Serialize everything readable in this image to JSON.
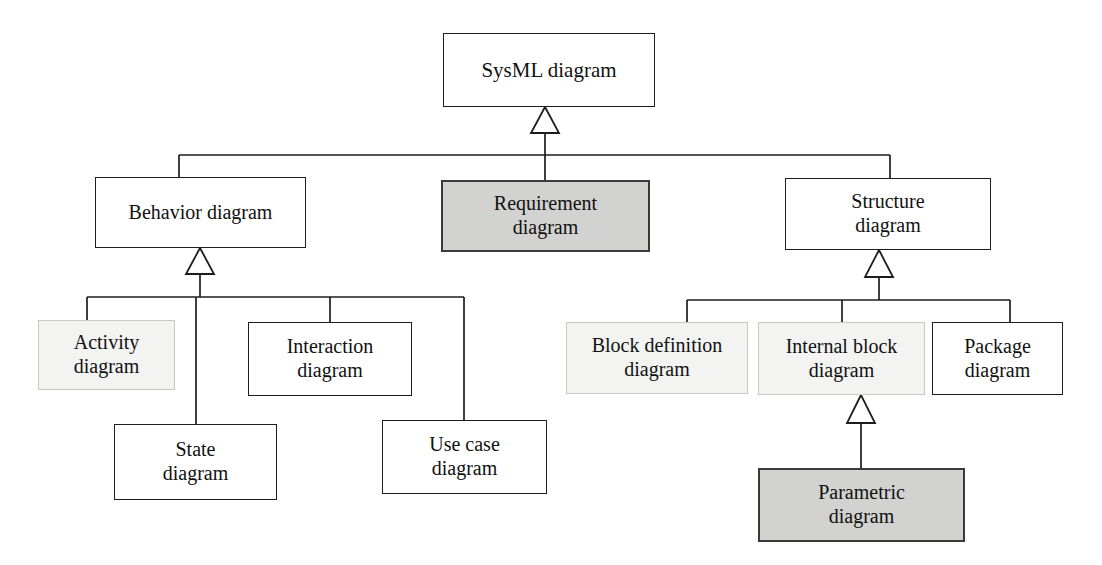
{
  "diagram": {
    "type": "hierarchy-tree",
    "notation": "UML/SysML generalization (hollow triangle arrowheads point to the parent)",
    "colors": {
      "background": "#ffffff",
      "line": "#1d1d1d",
      "text": "#111111",
      "plain_fill": "#ffffff",
      "plain_border": "#1d1d1d",
      "faint_fill": "#f3f3f1",
      "faint_border": "#c8c8c4",
      "shaded_fill": "#d2d2d0",
      "shaded_border": "#3a3a3a"
    },
    "nodes": [
      {
        "id": "sysml",
        "label": "SysML diagram",
        "style": "plain",
        "level": 0,
        "parent": null,
        "x": 443,
        "y": 33,
        "w": 212,
        "h": 74,
        "font_size": 21
      },
      {
        "id": "behavior",
        "label": "Behavior diagram",
        "style": "plain",
        "level": 1,
        "parent": "sysml",
        "x": 95,
        "y": 177,
        "w": 211,
        "h": 71,
        "font_size": 20
      },
      {
        "id": "requirement",
        "label": "Requirement\ndiagram",
        "style": "shaded",
        "level": 1,
        "parent": "sysml",
        "x": 441,
        "y": 180,
        "w": 209,
        "h": 72,
        "font_size": 20
      },
      {
        "id": "structure",
        "label": "Structure\ndiagram",
        "style": "plain",
        "level": 1,
        "parent": "sysml",
        "x": 785,
        "y": 178,
        "w": 206,
        "h": 72,
        "font_size": 20
      },
      {
        "id": "activity",
        "label": "Activity\ndiagram",
        "style": "faint",
        "level": 2,
        "parent": "behavior",
        "x": 38,
        "y": 320,
        "w": 137,
        "h": 70,
        "font_size": 20
      },
      {
        "id": "state",
        "label": "State\ndiagram",
        "style": "plain",
        "level": 2,
        "parent": "behavior",
        "x": 114,
        "y": 424,
        "w": 163,
        "h": 76,
        "font_size": 20
      },
      {
        "id": "interaction",
        "label": "Interaction\ndiagram",
        "style": "plain",
        "level": 2,
        "parent": "behavior",
        "x": 248,
        "y": 322,
        "w": 164,
        "h": 74,
        "font_size": 20
      },
      {
        "id": "usecase",
        "label": "Use case\ndiagram",
        "style": "plain",
        "level": 2,
        "parent": "behavior",
        "x": 382,
        "y": 420,
        "w": 165,
        "h": 74,
        "font_size": 20
      },
      {
        "id": "blockdef",
        "label": "Block definition\ndiagram",
        "style": "faint",
        "level": 2,
        "parent": "structure",
        "x": 566,
        "y": 322,
        "w": 182,
        "h": 72,
        "font_size": 20
      },
      {
        "id": "internalblock",
        "label": "Internal block\ndiagram",
        "style": "faint",
        "level": 2,
        "parent": "structure",
        "x": 758,
        "y": 322,
        "w": 167,
        "h": 73,
        "font_size": 20
      },
      {
        "id": "package",
        "label": "Package\ndiagram",
        "style": "plain",
        "level": 2,
        "parent": "structure",
        "x": 932,
        "y": 322,
        "w": 131,
        "h": 73,
        "font_size": 20
      },
      {
        "id": "parametric",
        "label": "Parametric\ndiagram",
        "style": "shaded",
        "level": 3,
        "parent": "internalblock",
        "x": 758,
        "y": 468,
        "w": 207,
        "h": 74,
        "font_size": 20
      }
    ],
    "edges": [
      {
        "id": "edge-sysml-children",
        "from_parent": "sysml",
        "to_children": [
          "behavior",
          "requirement",
          "structure"
        ],
        "arrow_at": "sysml",
        "bus_y": 155,
        "bus_x_start": 179,
        "bus_x_end": 890,
        "drop_xs": [
          179,
          545,
          890
        ],
        "stem_x": 545,
        "arrow_tip_y": 107,
        "arrow_base_y": 133
      },
      {
        "id": "edge-behavior-children",
        "from_parent": "behavior",
        "to_children": [
          "activity",
          "state",
          "interaction",
          "usecase"
        ],
        "arrow_at": "behavior",
        "bus_y": 297,
        "bus_x_start": 87,
        "bus_x_end": 464,
        "drop_xs": [
          87,
          196,
          330,
          464
        ],
        "stem_x": 200,
        "arrow_tip_y": 248,
        "arrow_base_y": 274
      },
      {
        "id": "edge-structure-children",
        "from_parent": "structure",
        "to_children": [
          "blockdef",
          "internalblock",
          "package"
        ],
        "arrow_at": "structure",
        "bus_y": 300,
        "bus_x_start": 687,
        "bus_x_end": 1010,
        "drop_xs": [
          687,
          842,
          1010
        ],
        "stem_x": 879,
        "arrow_tip_y": 250,
        "arrow_base_y": 277
      },
      {
        "id": "edge-internalblock-parametric",
        "from_parent": "internalblock",
        "to_children": [
          "parametric"
        ],
        "arrow_at": "internalblock",
        "stem_x": 861,
        "arrow_tip_y": 395,
        "arrow_base_y": 423,
        "drop_to_y": 468
      }
    ]
  }
}
